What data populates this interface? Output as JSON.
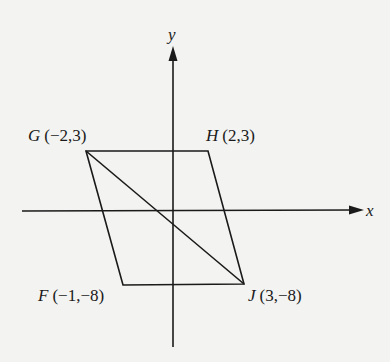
{
  "diagram": {
    "type": "coordinate-plane-parallelogram",
    "axes": {
      "x_label": "x",
      "y_label": "y"
    },
    "points": [
      {
        "name": "G",
        "coords": "(−2,3)",
        "x": -2,
        "y": 3
      },
      {
        "name": "H",
        "coords": "(2,3)",
        "x": 2,
        "y": 3
      },
      {
        "name": "J",
        "coords": "(3,−8)",
        "x": 3,
        "y": -8
      },
      {
        "name": "F",
        "coords": "(−1,−8)",
        "x": -1,
        "y": -8
      }
    ],
    "segments": [
      "GH",
      "HJ",
      "JF",
      "FG",
      "GJ"
    ],
    "colors": {
      "stroke": "#1a1a1a",
      "background": "#f3f3f1"
    }
  }
}
